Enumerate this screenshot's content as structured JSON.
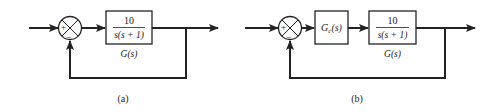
{
  "diagram": {
    "type": "block-diagram",
    "panels": [
      {
        "id": "a",
        "caption": "(a)",
        "summing_junction": {
          "plus_sign": "+",
          "minus_sign": "–"
        },
        "blocks": [
          {
            "id": "G",
            "numerator": "10",
            "denominator": "s(s + 1)",
            "label": "G(s)"
          }
        ],
        "feedback": "unity negative feedback"
      },
      {
        "id": "b",
        "caption": "(b)",
        "summing_junction": {
          "plus_sign": "+",
          "minus_sign": "–"
        },
        "blocks": [
          {
            "id": "Gc",
            "text": "Gc(s)",
            "main": "G",
            "sub": "c",
            "rest": "(s)"
          },
          {
            "id": "G",
            "numerator": "10",
            "denominator": "s(s + 1)",
            "label": "G(s)"
          }
        ],
        "feedback": "unity negative feedback"
      }
    ],
    "colors": {
      "line": "#222222",
      "background": "#ffffff"
    }
  }
}
